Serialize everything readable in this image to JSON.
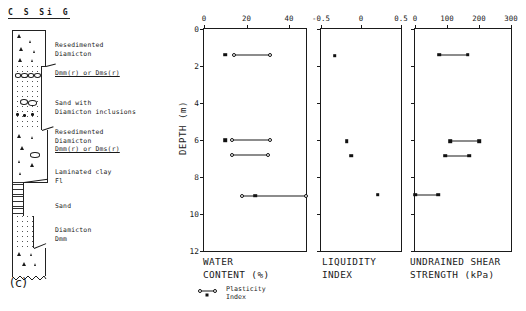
{
  "panel": {
    "label": "(c)"
  },
  "grain_size_header": "C S Si G",
  "lithology": {
    "units": [
      {
        "label": "Resedimented\nDiamicton",
        "code": ""
      },
      {
        "label": "",
        "code": "Dmm(r) or Dms(r)"
      },
      {
        "label": "Sand with\nDiamicton inclusions",
        "code": ""
      },
      {
        "label": "Resedimented\nDiamicton",
        "code": "Dmm(r) or Dms(r)"
      },
      {
        "label": "Laminated clay\nFl",
        "code": ""
      },
      {
        "label": "Sand",
        "code": ""
      },
      {
        "label": "Diamicton\nDmm",
        "code": ""
      }
    ]
  },
  "depth_axis": {
    "title": "DEPTH (m)",
    "ticks": [
      0,
      2,
      4,
      6,
      8,
      10,
      12
    ],
    "min": 0,
    "max": 12,
    "units": "m"
  },
  "legend": {
    "label": "Plasticity\nIndex",
    "symbol": "line-with-open-circle-endpoints"
  },
  "chart_data": [
    {
      "type": "scatter",
      "title": "WATER\nCONTENT (%)",
      "xlabel": "WATER CONTENT (%)",
      "ylabel": "DEPTH (m)",
      "xlim": [
        0,
        48
      ],
      "ylim": [
        0,
        12
      ],
      "xticks": [
        0,
        20,
        40
      ],
      "yticks": [
        0,
        2,
        4,
        6,
        8,
        10,
        12
      ],
      "y_inverted": true,
      "grid": false,
      "series": [
        {
          "name": "Water content",
          "marker": "filled-square",
          "points": [
            {
              "x": 10,
              "y": 1.4
            },
            {
              "x": 10,
              "y": 6.0
            },
            {
              "x": 24,
              "y": 9.0
            }
          ]
        },
        {
          "name": "Plasticity index range",
          "marker": "open-circle",
          "bars": [
            {
              "y": 1.4,
              "x_start": 14,
              "x_end": 31
            },
            {
              "y": 6.0,
              "x_start": 13,
              "x_end": 31
            },
            {
              "y": 6.8,
              "x_start": 13,
              "x_end": 30
            },
            {
              "y": 9.0,
              "x_start": 18,
              "x_end": 48
            }
          ]
        }
      ]
    },
    {
      "type": "scatter",
      "title": "LIQUIDITY\nINDEX",
      "xlabel": "LIQUIDITY INDEX",
      "ylabel": "DEPTH (m)",
      "xlim": [
        -0.5,
        0.5
      ],
      "ylim": [
        0,
        12
      ],
      "xticks": [
        -0.5,
        0,
        0.5
      ],
      "xtick_labels": [
        "-0.5",
        "0",
        "0.5"
      ],
      "yticks": [
        0,
        2,
        4,
        6,
        8,
        10,
        12
      ],
      "y_inverted": true,
      "grid": false,
      "series": [
        {
          "name": "Liquidity index",
          "marker": "filled-square",
          "points": [
            {
              "x": -0.33,
              "y": 1.45
            },
            {
              "x": -0.18,
              "y": 6.05
            },
            {
              "x": -0.12,
              "y": 6.85
            },
            {
              "x": 0.21,
              "y": 8.95
            }
          ]
        }
      ]
    },
    {
      "type": "bar",
      "orientation": "horizontal-range",
      "title": "UNDRAINED SHEAR\nSTRENGTH (kPa)",
      "xlabel": "UNDRAINED SHEAR STRENGTH (kPa)",
      "ylabel": "DEPTH (m)",
      "xlim": [
        0,
        300
      ],
      "ylim": [
        0,
        12
      ],
      "xticks": [
        0,
        100,
        200,
        300
      ],
      "yticks": [
        0,
        2,
        4,
        6,
        8,
        10,
        12
      ],
      "y_inverted": true,
      "grid": false,
      "series": [
        {
          "name": "Undrained shear strength range",
          "marker": "filled-square",
          "bars": [
            {
              "y": 1.4,
              "x_start": 75,
              "x_end": 165
            },
            {
              "y": 6.05,
              "x_start": 110,
              "x_end": 200
            },
            {
              "y": 6.85,
              "x_start": 95,
              "x_end": 170
            },
            {
              "y": 8.95,
              "x_start": 0,
              "x_end": 72
            }
          ]
        }
      ]
    }
  ]
}
